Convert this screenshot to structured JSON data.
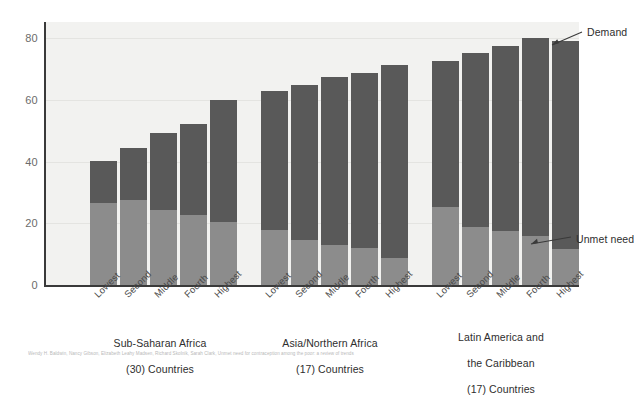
{
  "chart_data": {
    "type": "bar",
    "subtype": "stacked-bar-grouped",
    "title": "",
    "subtitle": "",
    "xlabel": "",
    "ylabel": "",
    "ylim": [
      0,
      88
    ],
    "yticks": [
      0,
      20,
      40,
      60,
      80
    ],
    "ytick_labels": [
      "0",
      "20",
      "40",
      "60",
      "80"
    ],
    "grid": true,
    "grid_axis": "y",
    "legend_position": "annotation-right",
    "categories": [
      "Lowest",
      "Second",
      "Middle",
      "Fourth",
      "Highest"
    ],
    "groups": [
      {
        "name": "Sub-Saharan Africa",
        "caption": "Sub-Saharan Africa\n(30) Countries",
        "country_count": "(30) Countries",
        "categories": [
          "Lowest",
          "Second",
          "Middle",
          "Fourth",
          "Highest"
        ],
        "demand": [
          41.5,
          46.0,
          51.0,
          54.0,
          62.0
        ],
        "unmet_need": [
          27.5,
          28.5,
          25.0,
          23.5,
          21.0
        ]
      },
      {
        "name": "Asia/Northern Africa",
        "caption": "Asia/Northern Africa\n(17) Countries",
        "country_count": "(17) Countries",
        "categories": [
          "Lowest",
          "Second",
          "Middle",
          "Fourth",
          "Highest"
        ],
        "demand": [
          65.0,
          67.0,
          69.5,
          71.0,
          73.5
        ],
        "unmet_need": [
          18.5,
          15.0,
          13.5,
          12.5,
          9.0
        ]
      },
      {
        "name": "Latin America and the Caribbean",
        "caption": "Latin America and\nthe Caribbean\n(17) Countries",
        "country_count": "(17) Countries",
        "categories": [
          "Lowest",
          "Second",
          "Middle",
          "Fourth",
          "Highest"
        ],
        "demand": [
          75.0,
          77.5,
          80.0,
          82.5,
          81.5
        ],
        "unmet_need": [
          26.0,
          19.5,
          18.0,
          16.5,
          12.0
        ]
      }
    ],
    "series": [
      {
        "name": "Demand",
        "color": "#595959"
      },
      {
        "name": "Unmet need",
        "color": "#8c8c8c"
      }
    ],
    "annotations": [
      {
        "text": "Demand",
        "target": "top-of-dark-segment"
      },
      {
        "text": "Unmet need",
        "target": "top-of-light-segment"
      }
    ]
  },
  "axis": {
    "y_ticks": [
      "80",
      "60",
      "40",
      "20",
      "0"
    ]
  },
  "quintiles": {
    "lowest": "Lowest",
    "second": "Second",
    "middle": "Middle",
    "fourth": "Fourth",
    "highest": "Highest"
  },
  "group_captions": {
    "g1_line1": "Sub-Saharan Africa",
    "g1_line2": "(30) Countries",
    "g2_line1": "Asia/Northern Africa",
    "g2_line2": "(17) Countries",
    "g3_line1": "Latin America and",
    "g3_line2": "the Caribbean",
    "g3_line3": "(17) Countries"
  },
  "annotations": {
    "demand": "Demand",
    "unmet_need": "Unmet need"
  },
  "colors": {
    "demand": "#595959",
    "unmet_need": "#8c8c8c",
    "plot_background": "#f2f2f0",
    "axis": "#3a3a3a",
    "gridline": "#e4e4e1",
    "tick_text": "#6b6b6b",
    "label_text": "#2e2e2e"
  },
  "footnote": {
    "text": "Wendy H. Baldwin, Nancy Gibson, Elizabeth Leahy Madsen, Richard Skolnik, Sarah Clark, Unmet need for contraception among the poor: a review of trends"
  }
}
